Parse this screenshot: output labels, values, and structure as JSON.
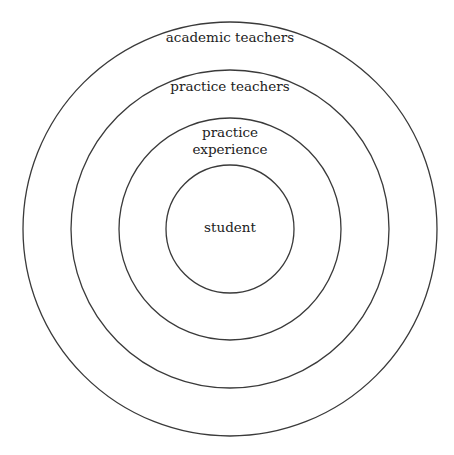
{
  "diagram": {
    "type": "concentric-circles",
    "center": {
      "x": 230,
      "y": 229
    },
    "stroke_color": "#3a3a3a",
    "rings": [
      {
        "name": "academic-teachers",
        "radius": 207,
        "label_lines": [
          "academic teachers"
        ],
        "label_y": [
          42
        ]
      },
      {
        "name": "practice-teachers",
        "radius": 159,
        "label_lines": [
          "practice teachers"
        ],
        "label_y": [
          91
        ]
      },
      {
        "name": "practice-experience",
        "radius": 111,
        "label_lines": [
          "practice",
          "experience"
        ],
        "label_y": [
          137,
          154
        ]
      },
      {
        "name": "student",
        "radius": 64,
        "label_lines": [
          "student"
        ],
        "label_y": [
          232
        ]
      }
    ]
  }
}
